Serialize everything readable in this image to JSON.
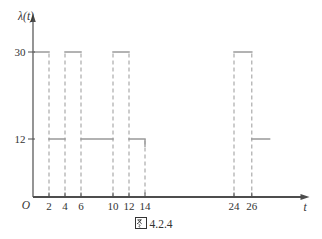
{
  "figure": {
    "y_axis_label": "λ(t)",
    "x_axis_label": "t",
    "origin_label": "O",
    "caption": {
      "hanzi": "图",
      "number": "4.2.4",
      "full": "图 4.2.4"
    }
  },
  "chart_data": {
    "type": "line",
    "subtype": "piecewise-constant-step",
    "xlabel": "t",
    "ylabel": "λ(t)",
    "x_ticks": [
      2,
      4,
      6,
      10,
      12,
      14,
      24,
      26
    ],
    "y_ticks": [
      30,
      12
    ],
    "ylim": [
      0,
      36
    ],
    "grid": false,
    "legend": "none",
    "segments": [
      {
        "y": 30,
        "x_start": 0,
        "x_end": 2,
        "drop_at_end": false
      },
      {
        "y": 12,
        "x_start": 2,
        "x_end": 4,
        "drop_at_end": false
      },
      {
        "y": 30,
        "x_start": 4,
        "x_end": 6,
        "drop_at_end": false
      },
      {
        "y": 12,
        "x_start": 6,
        "x_end": 10,
        "drop_at_end": false
      },
      {
        "y": 30,
        "x_start": 10,
        "x_end": 12,
        "drop_at_end": false
      },
      {
        "y": 12,
        "x_start": 12,
        "x_end": 14,
        "drop_at_end": true
      },
      {
        "y": 30,
        "x_start": 24,
        "x_end": 26,
        "drop_at_end": false
      },
      {
        "y": 12,
        "x_start": 26,
        "x_end": 28,
        "drop_at_end": false
      }
    ],
    "dashed_guides": [
      {
        "x": 2,
        "from_y": 30
      },
      {
        "x": 4,
        "from_y": 30
      },
      {
        "x": 6,
        "from_y": 30
      },
      {
        "x": 10,
        "from_y": 30
      },
      {
        "x": 12,
        "from_y": 30
      },
      {
        "x": 14,
        "from_y": 12
      },
      {
        "x": 24,
        "from_y": 30
      },
      {
        "x": 26,
        "from_y": 30
      }
    ],
    "colors": {
      "curve": "#999999",
      "dashed": "#a3a3a3",
      "axis": "#4d4d4d",
      "text": "#333333"
    }
  }
}
